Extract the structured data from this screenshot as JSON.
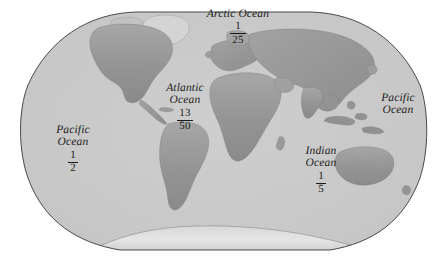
{
  "figure": {
    "kind": "world-map",
    "projection": "elliptical-world-projection",
    "background_color": "#ffffff",
    "ocean_color": "#c9c9c9",
    "land_color": "#9a9a9a",
    "border_color": "#4a4a4a",
    "ice_color": "#e2e2e2",
    "text_color": "#1b1b1b"
  },
  "labels": {
    "arctic": {
      "name_line_1": "Arctic Ocean",
      "numerator": "1",
      "denominator": "25"
    },
    "atlantic": {
      "name_line_1": "Atlantic",
      "name_line_2": "Ocean",
      "numerator": "13",
      "denominator": "50"
    },
    "pacific_west": {
      "name_line_1": "Pacific",
      "name_line_2": "Ocean",
      "numerator": "1",
      "denominator": "2"
    },
    "pacific_east": {
      "name_line_1": "Pacific",
      "name_line_2": "Ocean"
    },
    "indian": {
      "name_line_1": "Indian",
      "name_line_2": "Ocean",
      "numerator": "1",
      "denominator": "5"
    }
  }
}
